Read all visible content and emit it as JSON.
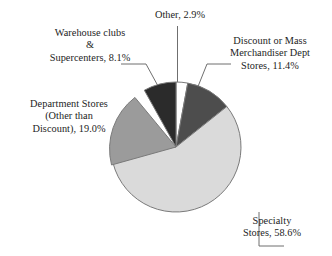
{
  "chart_data": {
    "type": "pie",
    "title": "",
    "subtitle": "",
    "xlabel": "",
    "ylabel": "",
    "legend_position": "none",
    "grid": false,
    "units": "percent",
    "start_angle_deg": 0,
    "direction": "clockwise",
    "categories": [
      "Other",
      "Discount or Mass Merchandiser Dept Stores",
      "Specialty Stores",
      "Department Stores (Other than Discount)",
      "Warehouse clubs & Supercenters"
    ],
    "values": [
      2.9,
      11.4,
      58.6,
      19.0,
      8.1
    ],
    "slices": [
      {
        "name": "other",
        "value": 2.9,
        "value_text": "2.9%",
        "color": "#ffffff",
        "angle_deg": 10.44,
        "label_lines": [
          "Other, 2.9%"
        ]
      },
      {
        "name": "discount-or-mass-merchandiser",
        "value": 11.4,
        "value_text": "11.4%",
        "color": "#4d4d4d",
        "angle_deg": 41.04,
        "label_lines": [
          "Discount or Mass",
          "Merchandiser Dept",
          "Stores, 11.4%"
        ]
      },
      {
        "name": "specialty-stores",
        "value": 58.6,
        "value_text": "58.6%",
        "color": "#dadada",
        "angle_deg": 210.96,
        "label_lines": [
          "Specialty",
          "Stores, 58.6%"
        ]
      },
      {
        "name": "department-stores-other-than-discount",
        "value": 19.0,
        "value_text": "19.0%",
        "color": "#9b9b9b",
        "angle_deg": 68.4,
        "label_lines": [
          "Department Stores",
          "(Other than",
          "Discount), 19.0%"
        ]
      },
      {
        "name": "warehouse-clubs-supercenters",
        "value": 8.1,
        "value_text": "8.1%",
        "color": "#2b2b2b",
        "angle_deg": 29.16,
        "label_lines": [
          "Warehouse clubs",
          "&",
          "Supercenters, 8.1%"
        ]
      }
    ]
  },
  "labels": {
    "other": {
      "line1": "Other, 2.9%"
    },
    "warehouse": {
      "line1": "Warehouse clubs",
      "line2": "&",
      "line3": "Supercenters, 8.1%"
    },
    "discount": {
      "line1": "Discount or Mass",
      "line2": "Merchandiser Dept",
      "line3": "Stores, 11.4%"
    },
    "department": {
      "line1": "Department Stores",
      "line2": "(Other than",
      "line3": "Discount), 19.0%"
    },
    "specialty": {
      "line1": "Specialty",
      "line2": "Stores, 58.6%"
    }
  },
  "style": {
    "background": "#ffffff",
    "outline": "#7a7a7a",
    "leader_line": "#6f6f6f",
    "text": "#1d1d1d"
  }
}
